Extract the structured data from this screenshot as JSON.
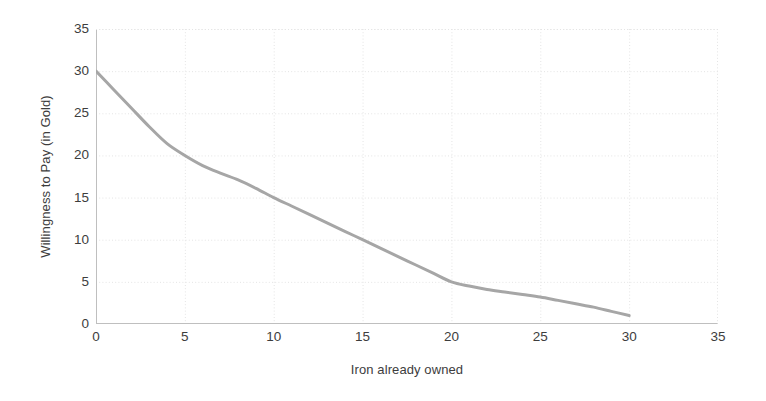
{
  "chart_data": {
    "type": "line",
    "title": "",
    "subtitle": "",
    "xlabel": "Iron already owned",
    "ylabel": "Willingness to Pay (in Gold)",
    "xlim": [
      0,
      35
    ],
    "ylim": [
      0,
      35
    ],
    "xticks": [
      0,
      5,
      10,
      15,
      20,
      25,
      30,
      35
    ],
    "yticks": [
      0,
      5,
      10,
      15,
      20,
      25,
      30,
      35
    ],
    "xticklabels": [
      "0",
      "5",
      "10",
      "15",
      "20",
      "25",
      "30",
      "35"
    ],
    "yticklabels": [
      "0",
      "5",
      "10",
      "15",
      "20",
      "25",
      "30",
      "35"
    ],
    "grid": true,
    "grid_color": "#e4e4e4",
    "legend": false,
    "legend_position": "none",
    "series": [
      {
        "name": "Willingness to Pay",
        "color": "#a6a6a6",
        "line_width": 3,
        "markers": false,
        "x": [
          0,
          1,
          2,
          3,
          4,
          5,
          6,
          7,
          8,
          9,
          10,
          11,
          12,
          13,
          14,
          15,
          16,
          17,
          18,
          19,
          20,
          21,
          22,
          23,
          24,
          25,
          26,
          27,
          28,
          29,
          30
        ],
        "y": [
          30,
          27.8,
          25.6,
          23.4,
          21.4,
          20,
          18.8,
          17.9,
          17.1,
          16.1,
          15,
          14,
          13,
          12,
          11,
          10,
          9,
          8,
          7,
          6,
          5,
          4.5,
          4.1,
          3.8,
          3.5,
          3.2,
          2.8,
          2.4,
          2.0,
          1.5,
          1
        ]
      }
    ]
  },
  "axis": {
    "line_color": "#bfbfbf",
    "tick_text_color": "#3d3d3d"
  }
}
